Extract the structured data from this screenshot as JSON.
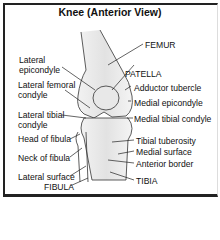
{
  "title": "Knee (Anterior View)",
  "labels_left": [
    {
      "id": "lateral-epicondyle",
      "text": "Lateral\nepicondyle"
    },
    {
      "id": "lateral-femoral-condyle",
      "text": "Lateral femoral\ncondyle"
    },
    {
      "id": "lateral-tibial-condyle",
      "text": "Lateral tibial\ncondyle"
    },
    {
      "id": "head-of-fibula",
      "text": "Head of fibula"
    },
    {
      "id": "neck-of-fibula",
      "text": "Neck of fibula"
    },
    {
      "id": "lateral-surface",
      "text": "Lateral surface"
    },
    {
      "id": "fibula",
      "text": "FIBULA"
    }
  ],
  "labels_right": [
    {
      "id": "femur",
      "text": "FEMUR"
    },
    {
      "id": "patella",
      "text": "PATELLA"
    },
    {
      "id": "adductor-tubercle",
      "text": "Adductor tubercle"
    },
    {
      "id": "medial-epicondyle",
      "text": "Medial epicondyle"
    },
    {
      "id": "medial-tibial-condyle",
      "text": "Medial tibial condyle"
    },
    {
      "id": "tibial-tuberosity",
      "text": "Tibial tuberosity"
    },
    {
      "id": "medial-surface",
      "text": "Medial surface"
    },
    {
      "id": "anterior-border",
      "text": "Anterior border"
    },
    {
      "id": "tibia",
      "text": "TIBIA"
    }
  ]
}
